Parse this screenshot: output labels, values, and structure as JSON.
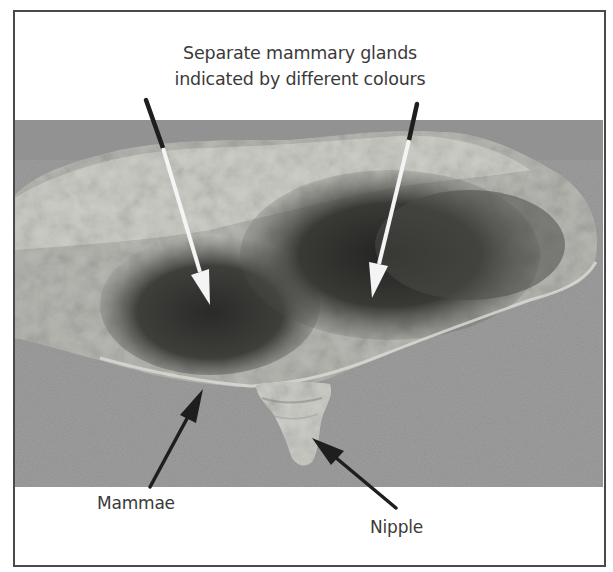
{
  "figure": {
    "caption_lines": [
      "Separate mammary glands",
      "indicated by different colours"
    ],
    "labels": {
      "mammae": "Mammae",
      "nipple": "Nipple"
    },
    "colors": {
      "frame_border": "#4a4a4a",
      "background_surface": "#9c9c9c",
      "tissue_pale": "#c9c9c4",
      "tissue_dark": "#3c3c3a",
      "label_text": "#3a3a3a",
      "arrow_white": "#f4f4f4",
      "arrow_black": "#1e1e1e"
    },
    "annotations": [
      {
        "name": "gland-arrow-left",
        "style": "white-with-black-tail",
        "from": [
          146,
          100
        ],
        "to": [
          210,
          305
        ]
      },
      {
        "name": "gland-arrow-right",
        "style": "white-with-black-tail",
        "from": [
          417,
          104
        ],
        "to": [
          372,
          298
        ]
      },
      {
        "name": "mammae-arrow",
        "style": "black",
        "from": [
          150,
          487
        ],
        "to": [
          203,
          389
        ]
      },
      {
        "name": "nipple-arrow",
        "style": "black",
        "from": [
          396,
          508
        ],
        "to": [
          312,
          438
        ]
      }
    ]
  }
}
